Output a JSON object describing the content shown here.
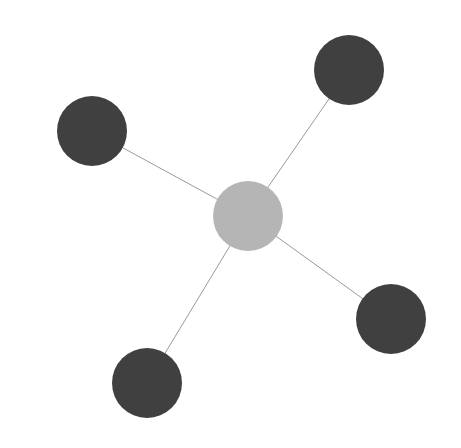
{
  "diagram": {
    "type": "star-graph",
    "background": "#ffffff",
    "edge_color": "#9a9a9a",
    "edge_width": 1,
    "nodes": [
      {
        "id": "center",
        "role": "hub",
        "cx": 248,
        "cy": 216,
        "r": 35,
        "fill": "#b5b5b5"
      },
      {
        "id": "top-left",
        "role": "leaf",
        "cx": 92,
        "cy": 131,
        "r": 35,
        "fill": "#404040"
      },
      {
        "id": "top-right",
        "role": "leaf",
        "cx": 349,
        "cy": 70,
        "r": 35,
        "fill": "#404040"
      },
      {
        "id": "bottom-right",
        "role": "leaf",
        "cx": 391,
        "cy": 319,
        "r": 35,
        "fill": "#404040"
      },
      {
        "id": "bottom-left",
        "role": "leaf",
        "cx": 147,
        "cy": 383,
        "r": 35,
        "fill": "#404040"
      }
    ],
    "edges": [
      {
        "from": "center",
        "to": "top-left"
      },
      {
        "from": "center",
        "to": "top-right"
      },
      {
        "from": "center",
        "to": "bottom-right"
      },
      {
        "from": "center",
        "to": "bottom-left"
      }
    ]
  }
}
